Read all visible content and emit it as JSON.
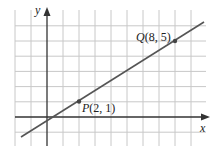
{
  "chart_data": {
    "type": "line",
    "title": "",
    "xlabel": "x",
    "ylabel": "y",
    "grid": true,
    "xlim": [
      -2,
      10
    ],
    "ylim": [
      -1,
      6
    ],
    "x_tick_step": 1,
    "y_tick_step": 1,
    "series": [
      {
        "name": "line PQ",
        "x": [
          -1.6,
          9.8
        ],
        "y": [
          -1.3,
          6.2
        ]
      }
    ],
    "points": [
      {
        "name": "P",
        "x": 2,
        "y": 1,
        "label": "P(2, 1)"
      },
      {
        "name": "Q",
        "x": 8,
        "y": 5,
        "label": "Q(8, 5)"
      }
    ]
  },
  "labels": {
    "x_axis": "x",
    "y_axis": "y",
    "p_name": "P",
    "p_coords": "(2, 1)",
    "q_name": "Q",
    "q_coords": "(8, 5)"
  },
  "colors": {
    "grid": "#c8c8c8",
    "axis": "#333333",
    "line": "#555555",
    "point": "#444444"
  }
}
